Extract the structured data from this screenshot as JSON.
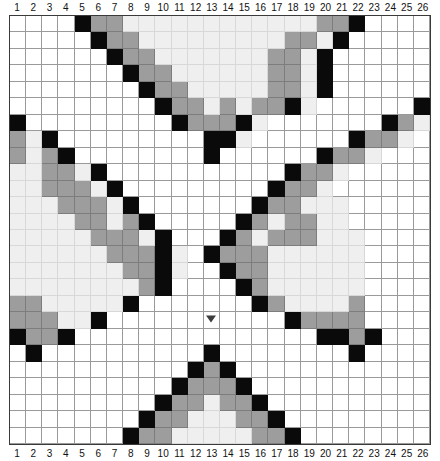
{
  "page": {
    "grid_size": {
      "cols": 26,
      "rows": 26
    }
  },
  "colors": {
    "white": "#ffffff",
    "light": "#efefef",
    "gray": "#9d9d9d",
    "black": "#0a0a0a",
    "gridline": "#9a9a9a",
    "border": "#3a3a3a",
    "marker": "#3d3d3d",
    "label": "#111111"
  },
  "legend": {
    "symbols": [
      "w",
      "l",
      "g",
      "k"
    ],
    "names": [
      "white",
      "light",
      "gray",
      "black"
    ]
  },
  "ruler": {
    "top_labels": [
      "1",
      "2",
      "3",
      "4",
      "5",
      "6",
      "7",
      "8",
      "9",
      "10",
      "11",
      "12",
      "13",
      "14",
      "15",
      "16",
      "17",
      "18",
      "19",
      "20",
      "21",
      "22",
      "23",
      "24",
      "25",
      "26"
    ],
    "bottom_labels": [
      "1",
      "2",
      "3",
      "4",
      "5",
      "6",
      "7",
      "8",
      "9",
      "10",
      "11",
      "12",
      "13",
      "14",
      "15",
      "16",
      "17",
      "18",
      "19",
      "20",
      "21",
      "22",
      "23",
      "24",
      "25",
      "26"
    ]
  },
  "marker": {
    "glyph": "triangle-down",
    "col": 13,
    "row": 19
  },
  "chart_data": {
    "type": "heatmap",
    "xlabel": "",
    "ylabel": "",
    "categories": [
      "1",
      "2",
      "3",
      "4",
      "5",
      "6",
      "7",
      "8",
      "9",
      "10",
      "11",
      "12",
      "13",
      "14",
      "15",
      "16",
      "17",
      "18",
      "19",
      "20",
      "21",
      "22",
      "23",
      "24",
      "25",
      "26"
    ],
    "palette": {
      "w": "#ffffff",
      "l": "#efefef",
      "g": "#9d9d9d",
      "k": "#0a0a0a"
    },
    "rows": [
      "wwwwkggllllllllllllggkwwww",
      "wwwwwkgglllllllllgglkwwwww",
      "wwwwwwkgglllllllgglkwwwwww",
      "wwwwwwwkggllllllgglkwwwwww",
      "wwwwwwwwkgglllllgglkwwwwww",
      "wwwwwwwwwkgglglggklwwwwwwk",
      "kwwwwwwwwwkgggklwwwwwwwkgl",
      "glkwwwwwwwwwkklwwwwwwkgglw",
      "glgkwwwwwwwwkwwwwwwkgglwww",
      "llgglkwwwwwwwwwwwkgglwwwww",
      "llggglkwwwwwwwwwkgglwwwwww",
      "lllggglkwwwwwwwkgglllwwwww",
      "llllgglgkwwwwwkglggllwwwww",
      "lllllggglkwwwkglggglllwwww",
      "llllllgggklwkgggllllllwwww",
      "lllllllggklwwkggllllllwwww",
      "llllllllgkwwwwkgllllllwwww",
      "gglllllkwwwwwwwkgllllgwwww",
      "gggllkwwwwwwwwwwwkggggwwww",
      "kggkwwwwwwwwwwwwwwwkkgkwww",
      "wkwwwwwwwwwwkwwwwwwwwkwwww",
      "wwwwwwwwwwwkgkwwwwwwwwwwww",
      "wwwwwwwwwwkgggkwwwwwwwwwww",
      "wwwwwwwwwkgglggkwwwwwwwwww",
      "wwwwwwwwkgglllggkwwwwwwwww",
      "wwwwwwwkgglllllggkwwwwwwww"
    ]
  }
}
